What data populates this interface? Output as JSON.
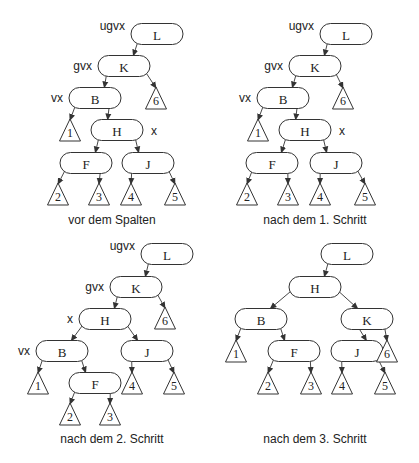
{
  "figure": {
    "style": {
      "stroke": "#333333",
      "fill": "#ffffff",
      "text": "#222222"
    },
    "node_size": {
      "w": 52,
      "h": 21
    },
    "triangle_size": {
      "w": 21,
      "h": 22
    },
    "panels": [
      {
        "caption": "vor dem Spalten",
        "caption_pos": [
          112,
          224
        ],
        "nodes": [
          {
            "id": "L",
            "label": "L",
            "cx": 157,
            "cy": 34
          },
          {
            "id": "K",
            "label": "K",
            "cx": 124,
            "cy": 66
          },
          {
            "id": "B",
            "label": "B",
            "cx": 95,
            "cy": 98
          },
          {
            "id": "H",
            "label": "H",
            "cx": 117,
            "cy": 130
          },
          {
            "id": "F",
            "label": "F",
            "cx": 86,
            "cy": 163
          },
          {
            "id": "J",
            "label": "J",
            "cx": 148,
            "cy": 163
          }
        ],
        "subtrees": [
          {
            "label": "6",
            "cx": 156,
            "top": 87
          },
          {
            "label": "1",
            "cx": 70,
            "top": 119
          },
          {
            "label": "2",
            "cx": 58,
            "top": 183
          },
          {
            "label": "3",
            "cx": 99,
            "top": 183
          },
          {
            "label": "4",
            "cx": 131,
            "top": 183
          },
          {
            "label": "5",
            "cx": 175,
            "top": 183
          }
        ],
        "edges": [
          {
            "from": "L",
            "side": "left",
            "to_node": "K"
          },
          {
            "from": "K",
            "side": "left",
            "to_node": "B"
          },
          {
            "from": "K",
            "side": "right",
            "to_tri": 0
          },
          {
            "from": "B",
            "side": "left",
            "to_tri": 1
          },
          {
            "from": "B",
            "side": "right",
            "to_node": "H"
          },
          {
            "from": "H",
            "side": "left",
            "to_node": "F"
          },
          {
            "from": "H",
            "side": "right",
            "to_node": "J"
          },
          {
            "from": "F",
            "side": "left",
            "to_tri": 2
          },
          {
            "from": "F",
            "side": "right",
            "to_tri": 3
          },
          {
            "from": "J",
            "side": "left",
            "to_tri": 4
          },
          {
            "from": "J",
            "side": "right",
            "to_tri": 5
          }
        ],
        "pointers": [
          {
            "label": "ugvx",
            "node": "L",
            "pos": "left"
          },
          {
            "label": "gvx",
            "node": "K",
            "pos": "left"
          },
          {
            "label": "vx",
            "node": "B",
            "pos": "left"
          },
          {
            "label": "x",
            "node": "H",
            "pos": "right"
          }
        ]
      },
      {
        "caption": "nach dem 1. Schritt",
        "caption_pos": [
          315,
          224
        ],
        "nodes": [
          {
            "id": "L",
            "label": "L",
            "cx": 346,
            "cy": 34
          },
          {
            "id": "K",
            "label": "K",
            "cx": 315,
            "cy": 66
          },
          {
            "id": "B",
            "label": "B",
            "cx": 283,
            "cy": 98
          },
          {
            "id": "H",
            "label": "H",
            "cx": 305,
            "cy": 130
          },
          {
            "id": "F",
            "label": "F",
            "cx": 272,
            "cy": 163
          },
          {
            "id": "J",
            "label": "J",
            "cx": 336,
            "cy": 163
          }
        ],
        "subtrees": [
          {
            "label": "6",
            "cx": 343,
            "top": 87
          },
          {
            "label": "1",
            "cx": 258,
            "top": 119
          },
          {
            "label": "2",
            "cx": 247,
            "top": 183
          },
          {
            "label": "3",
            "cx": 288,
            "top": 183
          },
          {
            "label": "4",
            "cx": 320,
            "top": 183
          },
          {
            "label": "5",
            "cx": 365,
            "top": 183
          }
        ],
        "edges": [
          {
            "from": "L",
            "side": "left",
            "to_node": "K"
          },
          {
            "from": "K",
            "side": "left",
            "to_node": "B"
          },
          {
            "from": "K",
            "side": "right",
            "to_tri": 0
          },
          {
            "from": "B",
            "side": "left",
            "to_tri": 1
          },
          {
            "from": "B",
            "side": "right",
            "to_node": "H"
          },
          {
            "from": "H",
            "side": "left",
            "to_node": "F"
          },
          {
            "from": "H",
            "side": "right",
            "to_node": "J"
          },
          {
            "from": "F",
            "side": "left",
            "to_tri": 2
          },
          {
            "from": "F",
            "side": "right",
            "to_tri": 3
          },
          {
            "from": "J",
            "side": "left",
            "to_tri": 4
          },
          {
            "from": "J",
            "side": "right",
            "to_tri": 5
          }
        ],
        "pointers": [
          {
            "label": "ugvx",
            "node": "L",
            "pos": "left"
          },
          {
            "label": "gvx",
            "node": "K",
            "pos": "left"
          },
          {
            "label": "vx",
            "node": "B",
            "pos": "left"
          },
          {
            "label": "x",
            "node": "H",
            "pos": "right"
          }
        ]
      },
      {
        "caption": "nach dem 2. Schritt",
        "caption_pos": [
          112,
          443
        ],
        "nodes": [
          {
            "id": "L",
            "label": "L",
            "cx": 167,
            "cy": 254
          },
          {
            "id": "K",
            "label": "K",
            "cx": 136,
            "cy": 287
          },
          {
            "id": "H",
            "label": "H",
            "cx": 105,
            "cy": 319
          },
          {
            "id": "B",
            "label": "B",
            "cx": 62,
            "cy": 351
          },
          {
            "id": "J",
            "label": "J",
            "cx": 147,
            "cy": 351
          },
          {
            "id": "F",
            "label": "F",
            "cx": 95,
            "cy": 383
          }
        ],
        "subtrees": [
          {
            "label": "6",
            "cx": 165,
            "top": 307
          },
          {
            "label": "1",
            "cx": 38,
            "top": 372
          },
          {
            "label": "4",
            "cx": 132,
            "top": 372
          },
          {
            "label": "5",
            "cx": 174,
            "top": 372
          },
          {
            "label": "2",
            "cx": 70,
            "top": 403
          },
          {
            "label": "3",
            "cx": 110,
            "top": 403
          }
        ],
        "edges": [
          {
            "from": "L",
            "side": "left",
            "to_node": "K"
          },
          {
            "from": "K",
            "side": "left",
            "to_node": "H"
          },
          {
            "from": "K",
            "side": "right",
            "to_tri": 0
          },
          {
            "from": "H",
            "side": "left",
            "to_node": "B"
          },
          {
            "from": "H",
            "side": "right",
            "to_node": "J"
          },
          {
            "from": "B",
            "side": "left",
            "to_tri": 1
          },
          {
            "from": "B",
            "side": "right",
            "to_node": "F"
          },
          {
            "from": "J",
            "side": "left",
            "to_tri": 2
          },
          {
            "from": "J",
            "side": "right",
            "to_tri": 3
          },
          {
            "from": "F",
            "side": "left",
            "to_tri": 4
          },
          {
            "from": "F",
            "side": "right",
            "to_tri": 5
          }
        ],
        "pointers": [
          {
            "label": "ugvx",
            "node": "L",
            "pos": "left"
          },
          {
            "label": "gvx",
            "node": "K",
            "pos": "left"
          },
          {
            "label": "x",
            "node": "H",
            "pos": "left"
          },
          {
            "label": "vx",
            "node": "B",
            "pos": "left"
          }
        ]
      },
      {
        "caption": "nach dem 3. Schritt",
        "caption_pos": [
          315,
          443
        ],
        "nodes": [
          {
            "id": "L",
            "label": "L",
            "cx": 347,
            "cy": 254
          },
          {
            "id": "H",
            "label": "H",
            "cx": 315,
            "cy": 287
          },
          {
            "id": "B",
            "label": "B",
            "cx": 261,
            "cy": 319
          },
          {
            "id": "K",
            "label": "K",
            "cx": 367,
            "cy": 319
          },
          {
            "id": "F",
            "label": "F",
            "cx": 294,
            "cy": 351
          },
          {
            "id": "J",
            "label": "J",
            "cx": 357,
            "cy": 351
          }
        ],
        "subtrees": [
          {
            "label": "1",
            "cx": 236,
            "top": 340
          },
          {
            "label": "6",
            "cx": 387,
            "top": 340
          },
          {
            "label": "2",
            "cx": 268,
            "top": 372
          },
          {
            "label": "3",
            "cx": 311,
            "top": 372
          },
          {
            "label": "4",
            "cx": 342,
            "top": 372
          },
          {
            "label": "5",
            "cx": 385,
            "top": 372
          }
        ],
        "edges": [
          {
            "from": "L",
            "side": "left",
            "to_node": "H"
          },
          {
            "from": "H",
            "side": "left",
            "to_node": "B"
          },
          {
            "from": "H",
            "side": "right",
            "to_node": "K"
          },
          {
            "from": "B",
            "side": "left",
            "to_tri": 0
          },
          {
            "from": "B",
            "side": "right",
            "to_node": "F"
          },
          {
            "from": "K",
            "side": "left",
            "to_node": "J"
          },
          {
            "from": "K",
            "side": "right",
            "to_tri": 1
          },
          {
            "from": "F",
            "side": "left",
            "to_tri": 2
          },
          {
            "from": "F",
            "side": "right",
            "to_tri": 3
          },
          {
            "from": "J",
            "side": "left",
            "to_tri": 4
          },
          {
            "from": "J",
            "side": "right",
            "to_tri": 5
          }
        ],
        "pointers": []
      }
    ]
  }
}
